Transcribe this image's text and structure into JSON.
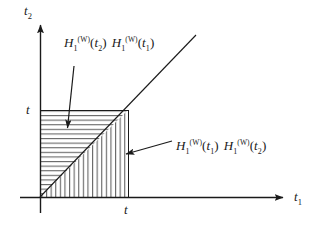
{
  "figure": {
    "background": "#ffffff",
    "ink_color": "#1a1a1a",
    "hatch_color": "#555555"
  },
  "axes": {
    "x": {
      "name_base": "t",
      "name_sub": "1",
      "origin_px": 40,
      "arrow_end_px": 285,
      "baseline_px": 197
    },
    "y": {
      "name_base": "t",
      "name_sub": "2",
      "origin_px": 197,
      "arrow_end_px": 22,
      "baseline_px": 40
    },
    "ticks": {
      "x_tick_label": "t",
      "x_tick_value_px": 128,
      "y_tick_label": "t",
      "y_tick_value_px": 110
    }
  },
  "square": {
    "left_px": 40,
    "right_px": 128,
    "top_px": 110,
    "bottom_px": 197
  },
  "diagonal": {
    "description": "line t2 = t1",
    "start_x_px": 40,
    "start_y_px": 197,
    "end_x_px": 196,
    "end_y_px": 35
  },
  "regions": {
    "upper_left": {
      "name": "upper-left-triangle",
      "hatching": "horizontal",
      "condition": "t2 > t1",
      "label": {
        "first_base": "H",
        "first_sub": "1",
        "first_sup": "(W)",
        "first_arg_base": "t",
        "first_arg_sub": "2",
        "second_base": "H",
        "second_sub": "1",
        "second_sup": "(W)",
        "second_arg_base": "t",
        "second_arg_sub": "1"
      }
    },
    "lower_right": {
      "name": "lower-right-triangle",
      "hatching": "vertical",
      "condition": "t1 > t2",
      "label": {
        "first_base": "H",
        "first_sub": "1",
        "first_sup": "(W)",
        "first_arg_base": "t",
        "first_arg_sub": "1",
        "second_base": "H",
        "second_sub": "1",
        "second_sup": "(W)",
        "second_arg_base": "t",
        "second_arg_sub": "2"
      }
    }
  },
  "annotations": {
    "upper_arrow": {
      "name": "arrow-to-upper-left-region",
      "from_x_px": 74,
      "from_y_px": 66,
      "to_x_px": 67,
      "to_y_px": 132
    },
    "lower_arrow": {
      "name": "arrow-to-lower-right-region",
      "from_x_px": 172,
      "from_y_px": 141,
      "to_x_px": 122,
      "to_y_px": 155
    }
  }
}
